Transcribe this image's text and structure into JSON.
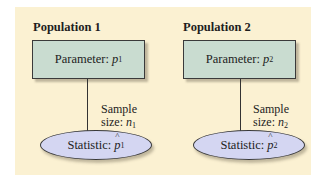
{
  "populations": [
    {
      "title": "Population 1",
      "parameter_label": "Parameter:",
      "parameter_symbol": "p",
      "parameter_subscript": "1",
      "sample_line1": "Sample",
      "sample_line2": "size:",
      "sample_symbol": "n",
      "sample_subscript": "1",
      "statistic_label": "Statistic:",
      "statistic_symbol": "p",
      "statistic_subscript": "1"
    },
    {
      "title": "Population 2",
      "parameter_label": "Parameter:",
      "parameter_symbol": "p",
      "parameter_subscript": "2",
      "sample_line1": "Sample",
      "sample_line2": "size:",
      "sample_symbol": "n",
      "sample_subscript": "2",
      "statistic_label": "Statistic:",
      "statistic_symbol": "p",
      "statistic_subscript": "2"
    }
  ],
  "colors": {
    "panel_bg": "#fbf1d2",
    "parameter_box": "#c9dcd0",
    "statistic_ellipse": "#d4d6f2"
  }
}
